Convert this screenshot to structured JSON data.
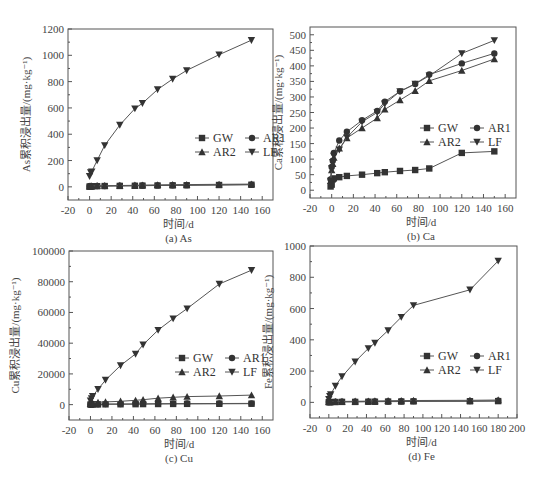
{
  "chart_data": [
    {
      "id": "a",
      "type": "line",
      "caption": "(a) As",
      "xlabel": "时间/d",
      "ylabel": "As累积浸出量/(mg·kg⁻¹)",
      "xlim": [
        -20,
        170
      ],
      "ylim": [
        -100,
        1200
      ],
      "xticks": [
        -20,
        0,
        20,
        40,
        60,
        80,
        100,
        120,
        140,
        160
      ],
      "yticks": [
        0,
        200,
        400,
        600,
        800,
        1000,
        1200
      ],
      "frame": {
        "left": 68,
        "top": 29,
        "right": 273,
        "bottom": 200
      },
      "legend": {
        "x": 195,
        "y": 138
      },
      "x": [
        0,
        1,
        2,
        7,
        14,
        28,
        42,
        49,
        63,
        77,
        90,
        120,
        150
      ],
      "series": [
        {
          "name": "GW",
          "marker": "square",
          "values": [
            2,
            3,
            4,
            5,
            6,
            7,
            8,
            9,
            10,
            11,
            12,
            14,
            16
          ]
        },
        {
          "name": "AR1",
          "marker": "circle",
          "values": [
            3,
            4,
            5,
            6,
            7,
            8,
            9,
            10,
            11,
            12,
            13,
            15,
            17
          ]
        },
        {
          "name": "AR2",
          "marker": "triangle",
          "values": [
            4,
            5,
            6,
            8,
            9,
            10,
            12,
            13,
            15,
            16,
            17,
            19,
            21
          ]
        },
        {
          "name": "LF",
          "marker": "tri-down",
          "values": [
            80,
            110,
            115,
            200,
            315,
            470,
            595,
            635,
            740,
            820,
            885,
            1005,
            1115
          ]
        }
      ]
    },
    {
      "id": "b",
      "type": "line",
      "caption": "(b) Ca",
      "xlabel": "时间/d",
      "ylabel": "Ca累积浸出量/(mg·kg⁻¹)",
      "xlim": [
        -20,
        170
      ],
      "ylim": [
        -25,
        525
      ],
      "xticks": [
        -20,
        0,
        20,
        40,
        60,
        80,
        100,
        120,
        140,
        160
      ],
      "yticks": [
        0,
        50,
        100,
        150,
        200,
        250,
        300,
        350,
        400,
        450,
        500
      ],
      "frame": {
        "left": 310,
        "top": 27,
        "right": 516,
        "bottom": 198
      },
      "legend": {
        "x": 420,
        "y": 128
      },
      "x": [
        -1,
        0,
        1,
        2,
        7,
        14,
        28,
        42,
        49,
        63,
        77,
        90,
        120,
        150
      ],
      "series": [
        {
          "name": "GW",
          "marker": "square",
          "values": [
            12,
            18,
            35,
            38,
            42,
            46,
            50,
            55,
            58,
            62,
            65,
            70,
            120,
            125
          ]
        },
        {
          "name": "AR1",
          "marker": "circle",
          "values": [
            35,
            75,
            95,
            120,
            160,
            188,
            225,
            255,
            285,
            318,
            342,
            372,
            408,
            440
          ]
        },
        {
          "name": "AR2",
          "marker": "triangle",
          "values": [
            30,
            65,
            85,
            105,
            135,
            168,
            200,
            232,
            260,
            290,
            320,
            352,
            385,
            422
          ]
        },
        {
          "name": "LF",
          "marker": "tri-down",
          "values": [
            30,
            70,
            90,
            110,
            130,
            170,
            220,
            250,
            278,
            318,
            342,
            368,
            440,
            482
          ]
        }
      ]
    },
    {
      "id": "c",
      "type": "line",
      "caption": "(c) Cu",
      "xlabel": "时间/d",
      "ylabel": "Cu累积浸出量/(mg·kg⁻¹)",
      "xlim": [
        -20,
        170
      ],
      "ylim": [
        -10000,
        100000
      ],
      "xticks": [
        -20,
        0,
        20,
        40,
        60,
        80,
        100,
        120,
        140,
        160
      ],
      "yticks": [
        0,
        20000,
        40000,
        60000,
        80000,
        100000
      ],
      "frame": {
        "left": 69,
        "top": 251,
        "right": 273,
        "bottom": 420
      },
      "legend": {
        "x": 175,
        "y": 358
      },
      "x": [
        0,
        1,
        2,
        7,
        14,
        28,
        42,
        49,
        63,
        77,
        90,
        120,
        150
      ],
      "series": [
        {
          "name": "GW",
          "marker": "square",
          "values": [
            50,
            80,
            100,
            150,
            200,
            250,
            300,
            350,
            400,
            450,
            500,
            550,
            600
          ]
        },
        {
          "name": "AR1",
          "marker": "circle",
          "values": [
            100,
            150,
            200,
            300,
            400,
            450,
            500,
            550,
            600,
            650,
            700,
            750,
            800
          ]
        },
        {
          "name": "AR2",
          "marker": "triangle",
          "values": [
            500,
            800,
            1000,
            1500,
            1800,
            2200,
            2800,
            3200,
            4200,
            4800,
            5200,
            5600,
            6200
          ]
        },
        {
          "name": "LF",
          "marker": "tri-down",
          "values": [
            2500,
            4000,
            5500,
            10000,
            16000,
            25500,
            33000,
            39000,
            48500,
            56000,
            62500,
            78500,
            87500
          ]
        }
      ]
    },
    {
      "id": "d",
      "type": "line",
      "caption": "(d) Fe",
      "xlabel": "时间/d",
      "ylabel": "Fe累积浸出量/(mg·kg⁻¹)",
      "xlim": [
        -20,
        200
      ],
      "ylim": [
        -100,
        1000
      ],
      "xticks": [
        -20,
        0,
        20,
        40,
        60,
        80,
        100,
        120,
        140,
        160,
        180,
        200
      ],
      "yticks": [
        0,
        200,
        400,
        600,
        800,
        1000
      ],
      "frame": {
        "left": 310,
        "top": 246,
        "right": 517,
        "bottom": 418
      },
      "legend": {
        "x": 420,
        "y": 356
      },
      "x": [
        0,
        1,
        2,
        7,
        14,
        28,
        42,
        49,
        63,
        77,
        90,
        150,
        180
      ],
      "series": [
        {
          "name": "GW",
          "marker": "square",
          "values": [
            1,
            1,
            2,
            2,
            3,
            3,
            4,
            4,
            5,
            5,
            6,
            7,
            8
          ]
        },
        {
          "name": "AR1",
          "marker": "circle",
          "values": [
            2,
            3,
            3,
            4,
            4,
            5,
            5,
            6,
            6,
            7,
            8,
            9,
            10
          ]
        },
        {
          "name": "AR2",
          "marker": "triangle",
          "values": [
            3,
            4,
            4,
            5,
            6,
            7,
            8,
            9,
            10,
            11,
            12,
            13,
            15
          ]
        },
        {
          "name": "LF",
          "marker": "tri-down",
          "values": [
            20,
            40,
            50,
            105,
            165,
            260,
            345,
            380,
            460,
            545,
            620,
            720,
            905
          ]
        }
      ]
    }
  ],
  "colors": {
    "line": "#555555",
    "marker": "#333333",
    "frame": "#555555",
    "text": "#444444"
  }
}
